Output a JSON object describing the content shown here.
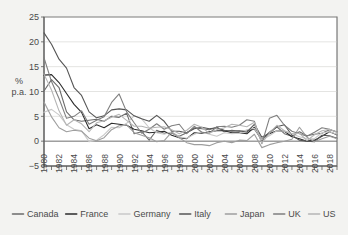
{
  "chart_data": {
    "type": "line",
    "title": "",
    "subtitle": "",
    "xlabel": "",
    "ylabel": "% p.a.",
    "ylabel_lines": [
      "%",
      "p.a."
    ],
    "xlim": [
      1980,
      2019
    ],
    "ylim": [
      -5,
      25
    ],
    "yticks": [
      -5,
      0,
      5,
      10,
      15,
      20,
      25
    ],
    "ytick_labels": [
      "−5",
      "0",
      "5",
      "10",
      "15",
      "20",
      "25"
    ],
    "xticks": [
      1980,
      1981,
      1982,
      1983,
      1984,
      1985,
      1986,
      1987,
      1988,
      1989,
      1990,
      1991,
      1992,
      1993,
      1994,
      1995,
      1996,
      1997,
      1998,
      1999,
      2000,
      2001,
      2002,
      2003,
      2004,
      2005,
      2006,
      2007,
      2008,
      2009,
      2010,
      2011,
      2012,
      2013,
      2014,
      2015,
      2016,
      2017,
      2018,
      2019
    ],
    "xtick_labels": [
      "1980",
      "1982",
      "1984",
      "1986",
      "1988",
      "1990",
      "1992",
      "1994",
      "1996",
      "1998",
      "2000",
      "2002",
      "2004",
      "2006",
      "2008",
      "2010",
      "2012",
      "2014",
      "2016",
      "2018"
    ],
    "xtick_label_years": [
      1980,
      1982,
      1984,
      1986,
      1988,
      1990,
      1992,
      1994,
      1996,
      1998,
      2000,
      2002,
      2004,
      2006,
      2008,
      2010,
      2012,
      2014,
      2016,
      2018
    ],
    "grid": "horizontal",
    "legend_position": "bottom",
    "x": [
      1980,
      1981,
      1982,
      1983,
      1984,
      1985,
      1986,
      1987,
      1988,
      1989,
      1990,
      1991,
      1992,
      1993,
      1994,
      1995,
      1996,
      1997,
      1998,
      1999,
      2000,
      2001,
      2002,
      2003,
      2004,
      2005,
      2006,
      2007,
      2008,
      2009,
      2010,
      2011,
      2012,
      2013,
      2014,
      2015,
      2016,
      2017,
      2018,
      2019
    ],
    "series": [
      {
        "name": "Canada",
        "color": "#6b6b6b",
        "values": [
          10.1,
          12.4,
          10.8,
          5.9,
          4.3,
          4.0,
          4.2,
          4.4,
          4.0,
          5.0,
          4.8,
          5.6,
          1.5,
          1.9,
          0.2,
          2.2,
          1.6,
          1.6,
          1.0,
          1.7,
          2.7,
          2.5,
          2.3,
          2.8,
          1.9,
          2.2,
          2.0,
          2.1,
          2.4,
          0.3,
          1.8,
          2.9,
          1.5,
          1.0,
          1.9,
          1.1,
          1.4,
          1.6,
          2.3,
          1.9
        ]
      },
      {
        "name": "France",
        "color": "#2b2b2b",
        "values": [
          13.3,
          13.4,
          11.8,
          9.6,
          7.4,
          5.8,
          2.5,
          3.3,
          2.7,
          3.6,
          3.4,
          3.2,
          2.4,
          2.1,
          1.7,
          1.8,
          2.0,
          1.2,
          0.7,
          0.5,
          1.7,
          1.6,
          1.9,
          2.1,
          2.1,
          1.7,
          1.7,
          1.5,
          2.8,
          0.1,
          1.5,
          2.1,
          2.0,
          0.9,
          0.5,
          0.0,
          0.2,
          1.0,
          1.9,
          1.3
        ]
      },
      {
        "name": "Germany",
        "color": "#c9c9c9",
        "values": [
          5.8,
          6.4,
          5.3,
          3.3,
          2.4,
          2.1,
          -0.1,
          0.2,
          1.3,
          2.8,
          2.7,
          3.6,
          5.1,
          4.5,
          2.7,
          1.7,
          1.4,
          1.9,
          0.9,
          0.6,
          1.4,
          1.9,
          1.4,
          1.0,
          1.7,
          1.5,
          1.6,
          2.3,
          2.6,
          0.3,
          1.1,
          2.1,
          2.0,
          1.5,
          0.9,
          0.5,
          0.5,
          1.7,
          1.9,
          1.4
        ]
      },
      {
        "name": "Italy",
        "color": "#555555",
        "values": [
          21.8,
          19.5,
          16.5,
          14.7,
          10.8,
          9.2,
          5.9,
          4.7,
          5.1,
          6.3,
          6.5,
          6.3,
          5.1,
          4.5,
          4.0,
          5.2,
          4.0,
          2.0,
          2.0,
          1.7,
          2.5,
          2.8,
          2.5,
          2.7,
          2.2,
          2.0,
          2.1,
          1.8,
          3.4,
          0.8,
          1.6,
          2.9,
          3.3,
          1.2,
          0.2,
          0.0,
          -0.1,
          1.2,
          1.1,
          0.6
        ]
      },
      {
        "name": "Japan",
        "color": "#9e9e9e",
        "values": [
          7.9,
          4.9,
          2.7,
          1.9,
          2.2,
          2.0,
          0.6,
          0.1,
          0.7,
          2.3,
          3.1,
          3.3,
          1.7,
          1.2,
          0.7,
          -0.1,
          0.1,
          1.8,
          0.7,
          -0.3,
          -0.7,
          -0.7,
          -0.9,
          -0.3,
          0.0,
          -0.3,
          0.2,
          0.1,
          1.4,
          -1.3,
          -0.7,
          -0.3,
          0.0,
          0.4,
          2.8,
          0.8,
          -0.1,
          0.5,
          1.0,
          0.5
        ]
      },
      {
        "name": "UK",
        "color": "#7f7f7f",
        "values": [
          16.8,
          12.0,
          8.6,
          4.6,
          5.0,
          6.1,
          3.4,
          4.2,
          4.9,
          7.8,
          9.5,
          5.9,
          3.7,
          1.6,
          2.4,
          3.5,
          2.4,
          3.1,
          3.4,
          1.5,
          3.0,
          1.8,
          1.6,
          2.9,
          3.0,
          2.8,
          3.2,
          4.3,
          4.0,
          -0.5,
          4.6,
          5.2,
          3.2,
          2.0,
          1.5,
          1.0,
          1.8,
          2.7,
          2.4,
          1.8
        ]
      },
      {
        "name": "US",
        "color": "#b5b5b5",
        "values": [
          13.5,
          10.3,
          6.1,
          3.2,
          4.3,
          3.5,
          1.9,
          3.7,
          4.1,
          4.8,
          5.4,
          4.2,
          3.0,
          3.0,
          2.6,
          2.8,
          2.9,
          2.3,
          1.5,
          2.2,
          3.4,
          2.8,
          1.6,
          2.3,
          2.7,
          3.4,
          3.2,
          2.9,
          3.8,
          -0.4,
          1.6,
          3.2,
          2.1,
          1.5,
          1.6,
          0.1,
          1.3,
          2.1,
          2.4,
          1.8
        ]
      }
    ]
  },
  "legend": {
    "items": [
      {
        "label": "Canada",
        "color": "#6b6b6b"
      },
      {
        "label": "France",
        "color": "#2b2b2b"
      },
      {
        "label": "Germany",
        "color": "#c9c9c9"
      },
      {
        "label": "Italy",
        "color": "#555555"
      },
      {
        "label": "Japan",
        "color": "#9e9e9e"
      },
      {
        "label": "UK",
        "color": "#7f7f7f"
      },
      {
        "label": "US",
        "color": "#b5b5b5"
      }
    ]
  }
}
